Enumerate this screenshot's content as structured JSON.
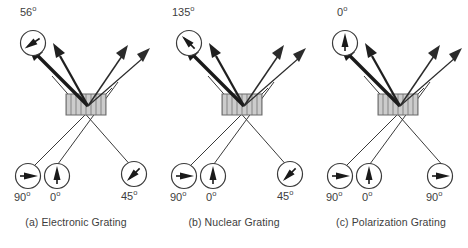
{
  "figure": {
    "type": "diagram",
    "colors": {
      "stroke": "#2b2b2b",
      "thick_arrow": "#1a1a1a",
      "grating_fill": "#c8c8c8",
      "grating_stripe": "#9a9a9a",
      "text": "#3d3d3d",
      "background": "#ffffff"
    }
  },
  "panels": [
    {
      "id": "a",
      "caption": "(a) Electronic Grating",
      "grating_label": "electronic-grating",
      "top_label": {
        "value": "56",
        "degree": "o"
      },
      "bottom_labels": [
        {
          "value": "90",
          "degree": "o"
        },
        {
          "value": "0",
          "degree": "o"
        },
        {
          "value": "45",
          "degree": "o"
        }
      ],
      "circles": [
        {
          "name": "top-left-polarization-circle",
          "angle_deg": 56,
          "label": "56"
        },
        {
          "name": "bottom-left-polarization-circle",
          "angle_deg": 90,
          "label": "90"
        },
        {
          "name": "bottom-center-polarization-circle",
          "angle_deg": 0,
          "label": "0"
        },
        {
          "name": "bottom-right-polarization-circle",
          "angle_deg": 45,
          "label": "45"
        }
      ],
      "beams": {
        "outgoing": [
          "thick-primary",
          "thick-secondary",
          "thin-primary",
          "thin-secondary"
        ],
        "incoming": [
          "from-bottom-left",
          "from-bottom-center",
          "from-bottom-right"
        ]
      }
    },
    {
      "id": "b",
      "caption": "(b) Nuclear Grating",
      "grating_label": "nuclear-grating",
      "top_label": {
        "value": "135",
        "degree": "o"
      },
      "bottom_labels": [
        {
          "value": "90",
          "degree": "o"
        },
        {
          "value": "0",
          "degree": "o"
        },
        {
          "value": "45",
          "degree": "o"
        }
      ],
      "circles": [
        {
          "name": "top-left-polarization-circle",
          "angle_deg": 135,
          "label": "135"
        },
        {
          "name": "bottom-left-polarization-circle",
          "angle_deg": 90,
          "label": "90"
        },
        {
          "name": "bottom-center-polarization-circle",
          "angle_deg": 0,
          "label": "0"
        },
        {
          "name": "bottom-right-polarization-circle",
          "angle_deg": 45,
          "label": "45"
        }
      ],
      "beams": {
        "outgoing": [
          "thick-primary",
          "thick-secondary",
          "thin-primary",
          "thin-secondary"
        ],
        "incoming": [
          "from-bottom-left",
          "from-bottom-center",
          "from-bottom-right"
        ]
      }
    },
    {
      "id": "c",
      "caption": "(c) Polarization Grating",
      "grating_label": "polarization-grating",
      "top_label": {
        "value": "0",
        "degree": "o"
      },
      "bottom_labels": [
        {
          "value": "90",
          "degree": "o"
        },
        {
          "value": "0",
          "degree": "o"
        },
        {
          "value": "90",
          "degree": "o"
        }
      ],
      "circles": [
        {
          "name": "top-left-polarization-circle",
          "angle_deg": 0,
          "label": "0"
        },
        {
          "name": "bottom-left-polarization-circle",
          "angle_deg": 90,
          "label": "90"
        },
        {
          "name": "bottom-center-polarization-circle",
          "angle_deg": 0,
          "label": "0"
        },
        {
          "name": "bottom-right-polarization-circle",
          "angle_deg": 90,
          "label": "90"
        }
      ],
      "beams": {
        "outgoing": [
          "thick-primary",
          "thick-secondary",
          "thin-primary",
          "thin-secondary"
        ],
        "incoming": [
          "from-bottom-left",
          "from-bottom-center",
          "from-bottom-right"
        ]
      }
    }
  ]
}
